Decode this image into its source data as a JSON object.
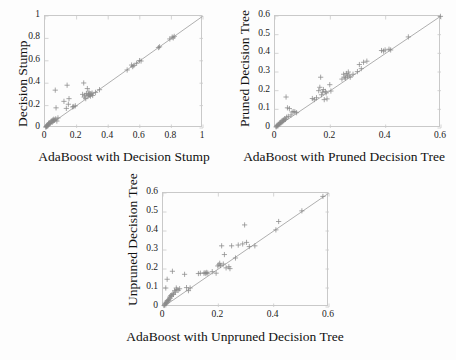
{
  "figure": {
    "marker": "plus-marker",
    "marker_color": "#8a8a8a",
    "line_color": "#9a9a9a",
    "axis_color": "#c9c9c9",
    "background": "#fdfdfd"
  },
  "chart_data": [
    {
      "id": "decision-stump",
      "type": "scatter",
      "title": "",
      "xlabel": "AdaBoost with Decision Stump",
      "ylabel": "Decision Stump",
      "xlim": [
        0,
        1
      ],
      "ylim": [
        0,
        1
      ],
      "xticks": [
        0,
        0.2,
        0.4,
        0.6,
        0.8,
        1
      ],
      "yticks": [
        0,
        0.2,
        0.4,
        0.6,
        0.8,
        1
      ],
      "xticklabels": [
        "0",
        "0.2",
        "0.4",
        "0.6",
        "0.8",
        "1"
      ],
      "yticklabels": [
        "0",
        "0.2",
        "0.4",
        "0.6",
        "0.8",
        "1"
      ],
      "grid": false,
      "legend": "none",
      "reference_line": {
        "type": "identity",
        "from": [
          0,
          0
        ],
        "to": [
          1,
          1
        ]
      },
      "points": [
        [
          0.005,
          0.008
        ],
        [
          0.008,
          0.012
        ],
        [
          0.01,
          0.016
        ],
        [
          0.012,
          0.02
        ],
        [
          0.015,
          0.018
        ],
        [
          0.018,
          0.03
        ],
        [
          0.02,
          0.026
        ],
        [
          0.022,
          0.042
        ],
        [
          0.025,
          0.035
        ],
        [
          0.03,
          0.048
        ],
        [
          0.032,
          0.04
        ],
        [
          0.038,
          0.055
        ],
        [
          0.04,
          0.062
        ],
        [
          0.045,
          0.05
        ],
        [
          0.048,
          0.07
        ],
        [
          0.052,
          0.06
        ],
        [
          0.055,
          0.078
        ],
        [
          0.058,
          0.068
        ],
        [
          0.062,
          0.072
        ],
        [
          0.065,
          0.338
        ],
        [
          0.068,
          0.082
        ],
        [
          0.07,
          0.18
        ],
        [
          0.075,
          0.062
        ],
        [
          0.082,
          0.09
        ],
        [
          0.12,
          0.238
        ],
        [
          0.135,
          0.175
        ],
        [
          0.14,
          0.382
        ],
        [
          0.148,
          0.212
        ],
        [
          0.152,
          0.262
        ],
        [
          0.175,
          0.188
        ],
        [
          0.182,
          0.192
        ],
        [
          0.192,
          0.198
        ],
        [
          0.238,
          0.3
        ],
        [
          0.245,
          0.402
        ],
        [
          0.248,
          0.276
        ],
        [
          0.252,
          0.292
        ],
        [
          0.258,
          0.262
        ],
        [
          0.262,
          0.308
        ],
        [
          0.268,
          0.352
        ],
        [
          0.272,
          0.286
        ],
        [
          0.275,
          0.298
        ],
        [
          0.278,
          0.322
        ],
        [
          0.282,
          0.292
        ],
        [
          0.285,
          0.305
        ],
        [
          0.288,
          0.285
        ],
        [
          0.292,
          0.3
        ],
        [
          0.298,
          0.312
        ],
        [
          0.302,
          0.29
        ],
        [
          0.32,
          0.318
        ],
        [
          0.345,
          0.342
        ],
        [
          0.52,
          0.518
        ],
        [
          0.548,
          0.562
        ],
        [
          0.555,
          0.548
        ],
        [
          0.562,
          0.558
        ],
        [
          0.58,
          0.578
        ],
        [
          0.598,
          0.602
        ],
        [
          0.608,
          0.598
        ],
        [
          0.718,
          0.718
        ],
        [
          0.725,
          0.725
        ],
        [
          0.79,
          0.795
        ],
        [
          0.805,
          0.812
        ],
        [
          0.812,
          0.805
        ],
        [
          0.818,
          0.818
        ]
      ]
    },
    {
      "id": "pruned-decision-tree",
      "type": "scatter",
      "title": "",
      "xlabel": "AdaBoost with Pruned Decision Tree",
      "ylabel": "Pruned Decision Tree",
      "xlim": [
        0,
        0.6
      ],
      "ylim": [
        0,
        0.6
      ],
      "xticks": [
        0,
        0.2,
        0.4,
        0.6
      ],
      "yticks": [
        0,
        0.1,
        0.2,
        0.3,
        0.4,
        0.5,
        0.6
      ],
      "xticklabels": [
        "0",
        "0.2",
        "0.4",
        "0.6"
      ],
      "yticklabels": [
        "0",
        "0.1",
        "0.2",
        "0.3",
        "0.4",
        "0.5",
        "0.6"
      ],
      "grid": false,
      "legend": "none",
      "reference_line": {
        "type": "identity",
        "from": [
          0,
          0
        ],
        "to": [
          0.6,
          0.6
        ]
      },
      "points": [
        [
          0.004,
          0.006
        ],
        [
          0.006,
          0.01
        ],
        [
          0.008,
          0.014
        ],
        [
          0.01,
          0.012
        ],
        [
          0.012,
          0.02
        ],
        [
          0.014,
          0.018
        ],
        [
          0.016,
          0.026
        ],
        [
          0.018,
          0.022
        ],
        [
          0.02,
          0.03
        ],
        [
          0.022,
          0.028
        ],
        [
          0.025,
          0.038
        ],
        [
          0.028,
          0.034
        ],
        [
          0.03,
          0.044
        ],
        [
          0.032,
          0.04
        ],
        [
          0.035,
          0.05
        ],
        [
          0.038,
          0.046
        ],
        [
          0.04,
          0.166
        ],
        [
          0.042,
          0.058
        ],
        [
          0.045,
          0.108
        ],
        [
          0.048,
          0.062
        ],
        [
          0.052,
          0.104
        ],
        [
          0.058,
          0.07
        ],
        [
          0.062,
          0.086
        ],
        [
          0.068,
          0.088
        ],
        [
          0.072,
          0.086
        ],
        [
          0.078,
          0.082
        ],
        [
          0.135,
          0.158
        ],
        [
          0.142,
          0.152
        ],
        [
          0.15,
          0.162
        ],
        [
          0.158,
          0.2
        ],
        [
          0.162,
          0.218
        ],
        [
          0.165,
          0.272
        ],
        [
          0.168,
          0.178
        ],
        [
          0.172,
          0.192
        ],
        [
          0.175,
          0.206
        ],
        [
          0.178,
          0.152
        ],
        [
          0.182,
          0.196
        ],
        [
          0.185,
          0.188
        ],
        [
          0.188,
          0.156
        ],
        [
          0.198,
          0.232
        ],
        [
          0.202,
          0.198
        ],
        [
          0.242,
          0.262
        ],
        [
          0.248,
          0.288
        ],
        [
          0.252,
          0.272
        ],
        [
          0.255,
          0.268
        ],
        [
          0.258,
          0.292
        ],
        [
          0.262,
          0.278
        ],
        [
          0.265,
          0.3
        ],
        [
          0.268,
          0.284
        ],
        [
          0.272,
          0.272
        ],
        [
          0.282,
          0.288
        ],
        [
          0.298,
          0.302
        ],
        [
          0.305,
          0.34
        ],
        [
          0.312,
          0.318
        ],
        [
          0.32,
          0.352
        ],
        [
          0.332,
          0.358
        ],
        [
          0.385,
          0.415
        ],
        [
          0.392,
          0.412
        ],
        [
          0.398,
          0.418
        ],
        [
          0.412,
          0.422
        ],
        [
          0.418,
          0.418
        ],
        [
          0.482,
          0.488
        ],
        [
          0.598,
          0.598
        ]
      ]
    },
    {
      "id": "unpruned-decision-tree",
      "type": "scatter",
      "title": "",
      "xlabel": "AdaBoost  with Unpruned Decision Tree",
      "ylabel": "Unpruned Decision Tree",
      "xlim": [
        0,
        0.6
      ],
      "ylim": [
        0,
        0.6
      ],
      "xticks": [
        0,
        0.2,
        0.4,
        0.6
      ],
      "yticks": [
        0,
        0.1,
        0.2,
        0.3,
        0.4,
        0.5,
        0.6
      ],
      "xticklabels": [
        "0",
        "0.2",
        "0.4",
        "0.6"
      ],
      "yticklabels": [
        "0",
        "0.1",
        "0.2",
        "0.3",
        "0.4",
        "0.5",
        "0.6"
      ],
      "grid": false,
      "legend": "none",
      "reference_line": {
        "type": "identity",
        "from": [
          0,
          0
        ],
        "to": [
          0.6,
          0.6
        ]
      },
      "points": [
        [
          0.004,
          0.008
        ],
        [
          0.006,
          0.012
        ],
        [
          0.008,
          0.02
        ],
        [
          0.01,
          0.016
        ],
        [
          0.01,
          0.1
        ],
        [
          0.012,
          0.026
        ],
        [
          0.014,
          0.022
        ],
        [
          0.015,
          0.146
        ],
        [
          0.016,
          0.034
        ],
        [
          0.018,
          0.03
        ],
        [
          0.02,
          0.04
        ],
        [
          0.022,
          0.036
        ],
        [
          0.024,
          0.052
        ],
        [
          0.026,
          0.046
        ],
        [
          0.028,
          0.06
        ],
        [
          0.03,
          0.056
        ],
        [
          0.032,
          0.064
        ],
        [
          0.034,
          0.188
        ],
        [
          0.036,
          0.07
        ],
        [
          0.038,
          0.066
        ],
        [
          0.042,
          0.086
        ],
        [
          0.045,
          0.078
        ],
        [
          0.048,
          0.1
        ],
        [
          0.05,
          0.092
        ],
        [
          0.055,
          0.088
        ],
        [
          0.06,
          0.096
        ],
        [
          0.078,
          0.172
        ],
        [
          0.085,
          0.102
        ],
        [
          0.092,
          0.086
        ],
        [
          0.098,
          0.1
        ],
        [
          0.128,
          0.176
        ],
        [
          0.135,
          0.178
        ],
        [
          0.148,
          0.178
        ],
        [
          0.152,
          0.18
        ],
        [
          0.155,
          0.176
        ],
        [
          0.158,
          0.182
        ],
        [
          0.162,
          0.178
        ],
        [
          0.178,
          0.186
        ],
        [
          0.192,
          0.178
        ],
        [
          0.198,
          0.216
        ],
        [
          0.202,
          0.222
        ],
        [
          0.205,
          0.23
        ],
        [
          0.208,
          0.218
        ],
        [
          0.212,
          0.322
        ],
        [
          0.218,
          0.226
        ],
        [
          0.222,
          0.276
        ],
        [
          0.228,
          0.206
        ],
        [
          0.238,
          0.212
        ],
        [
          0.242,
          0.202
        ],
        [
          0.248,
          0.322
        ],
        [
          0.262,
          0.258
        ],
        [
          0.272,
          0.326
        ],
        [
          0.288,
          0.332
        ],
        [
          0.295,
          0.432
        ],
        [
          0.302,
          0.34
        ],
        [
          0.312,
          0.318
        ],
        [
          0.332,
          0.322
        ],
        [
          0.408,
          0.406
        ],
        [
          0.418,
          0.45
        ],
        [
          0.502,
          0.506
        ],
        [
          0.578,
          0.582
        ]
      ]
    }
  ]
}
